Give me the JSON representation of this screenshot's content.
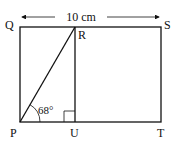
{
  "diagram": {
    "labels": {
      "Q": "Q",
      "R": "R",
      "S": "S",
      "P": "P",
      "U": "U",
      "T": "T"
    },
    "dimension": "10 cm",
    "angle": "68°",
    "colors": {
      "line": "#111111",
      "background": "#ffffff"
    }
  }
}
